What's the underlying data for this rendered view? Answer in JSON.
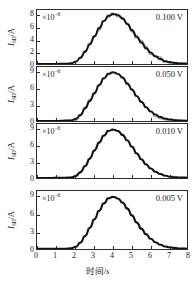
{
  "figure": {
    "panel_count": 4,
    "axis_color": "#2b2b2b",
    "fit_curve_color": "#111111",
    "data_trace_color": "#9a9a9a"
  },
  "xaxis": {
    "title_cn": "时间/s",
    "title_text": "时间",
    "unit": "s",
    "min": 0,
    "max": 8,
    "ticks": [
      "0",
      "1",
      "2",
      "3",
      "4",
      "5",
      "6",
      "7",
      "8"
    ],
    "tick_values": [
      0,
      1,
      2,
      3,
      4,
      5,
      6,
      7,
      8
    ]
  },
  "yaxis_common": {
    "label_symbol": "I",
    "label_subscript": "SD",
    "label_unit": "A",
    "multiplier_base": "×10",
    "multiplier_exponent": "−6"
  },
  "chart_data": {
    "type": "line",
    "title": "",
    "xlabel": "时间/s",
    "ylabel": "I_SD/A",
    "grid": false,
    "legend": "none",
    "shared_x": [
      0,
      0.25,
      0.5,
      0.75,
      1,
      1.25,
      1.5,
      1.75,
      2,
      2.25,
      2.5,
      2.75,
      3,
      3.25,
      3.5,
      3.75,
      4,
      4.25,
      4.5,
      4.75,
      5,
      5.25,
      5.5,
      5.75,
      6,
      6.25,
      6.5,
      6.75,
      7,
      7.25,
      7.5,
      7.75,
      8
    ],
    "xlim": [
      0,
      8
    ],
    "panels": [
      {
        "voltage_label": "0.100 V",
        "voltage_value": 0.1,
        "multiplier": "×10⁻⁶",
        "exponent": -6,
        "ylim": [
          0,
          8.8
        ],
        "yticks": [
          0,
          2,
          4,
          6,
          8
        ],
        "ytick_labels": [
          "0",
          "2",
          "4",
          "6",
          "8"
        ],
        "has_noise_trace": true,
        "noise_amplitude": 0.22,
        "series": [
          {
            "name": "fit",
            "values": [
              0.02,
              0.02,
              0.02,
              0.03,
              0.03,
              0.04,
              0.05,
              0.1,
              0.3,
              0.95,
              1.95,
              3.1,
              4.4,
              5.75,
              6.95,
              7.8,
              8.15,
              8.0,
              7.45,
              6.6,
              5.6,
              4.55,
              3.55,
              2.65,
              1.9,
              1.3,
              0.85,
              0.52,
              0.32,
              0.2,
              0.13,
              0.09,
              0.07
            ]
          }
        ]
      },
      {
        "voltage_label": "0.050 V",
        "voltage_value": 0.05,
        "multiplier": "×10⁻⁶",
        "exponent": -6,
        "ylim": [
          0,
          9.9
        ],
        "yticks": [
          0,
          3,
          6,
          9
        ],
        "ytick_labels": [
          "0",
          "3",
          "6",
          "9"
        ],
        "has_noise_trace": true,
        "noise_amplitude": 0.2,
        "series": [
          {
            "name": "fit",
            "values": [
              0.02,
              0.02,
              0.02,
              0.03,
              0.03,
              0.04,
              0.06,
              0.12,
              0.35,
              1.05,
              2.2,
              3.55,
              5.05,
              6.5,
              7.75,
              8.65,
              8.95,
              8.7,
              8.0,
              7.0,
              5.85,
              4.65,
              3.55,
              2.6,
              1.8,
              1.2,
              0.78,
              0.48,
              0.3,
              0.19,
              0.12,
              0.08,
              0.06
            ]
          }
        ]
      },
      {
        "voltage_label": "0.010 V",
        "voltage_value": 0.01,
        "multiplier": "×10⁻⁶",
        "exponent": -6,
        "ylim": [
          0,
          9.9
        ],
        "yticks": [
          0,
          3,
          6,
          9
        ],
        "ytick_labels": [
          "0",
          "3",
          "6",
          "9"
        ],
        "has_noise_trace": false,
        "noise_amplitude": 0.0,
        "series": [
          {
            "name": "fit",
            "values": [
              0.02,
              0.02,
              0.02,
              0.02,
              0.03,
              0.03,
              0.05,
              0.1,
              0.32,
              1.0,
              2.1,
              3.45,
              4.95,
              6.4,
              7.7,
              8.6,
              8.9,
              8.65,
              7.95,
              6.95,
              5.8,
              4.6,
              3.5,
              2.55,
              1.78,
              1.18,
              0.76,
              0.47,
              0.29,
              0.18,
              0.12,
              0.08,
              0.06
            ]
          }
        ]
      },
      {
        "voltage_label": "0.005 V",
        "voltage_value": 0.005,
        "multiplier": "×10⁻⁶",
        "exponent": -6,
        "ylim": [
          0,
          9.9
        ],
        "yticks": [
          0,
          3,
          6,
          9
        ],
        "ytick_labels": [
          "0",
          "3",
          "6",
          "9"
        ],
        "has_noise_trace": false,
        "noise_amplitude": 0.0,
        "series": [
          {
            "name": "fit",
            "values": [
              0.02,
              0.02,
              0.02,
              0.02,
              0.03,
              0.03,
              0.05,
              0.11,
              0.33,
              1.02,
              2.15,
              3.5,
              5.0,
              6.45,
              7.72,
              8.62,
              8.92,
              8.68,
              7.98,
              6.98,
              5.82,
              4.62,
              3.52,
              2.58,
              1.8,
              1.2,
              0.78,
              0.48,
              0.3,
              0.19,
              0.12,
              0.08,
              0.06
            ]
          }
        ]
      }
    ]
  }
}
